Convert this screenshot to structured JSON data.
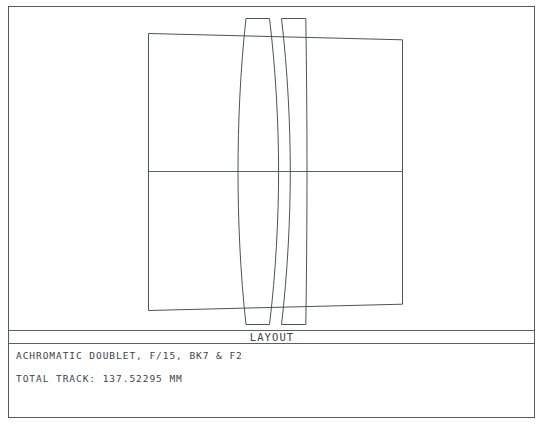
{
  "window": {
    "title": "LAYOUT",
    "background_color": "#ffffff",
    "line_color": "#4e5356",
    "text_color": "#3d4245"
  },
  "caption": {
    "panel_title": "LAYOUT",
    "description_line": "ACHROMATIC DOUBLET, F/15, BK7 & F2",
    "total_track_label": "TOTAL TRACK:",
    "total_track_value": "137.52295 MM",
    "total_track_line": "TOTAL TRACK:   137.52295 MM"
  },
  "diagram": {
    "type": "optical-layout",
    "system_name": "ACHROMATIC DOUBLET",
    "f_number": "F/15",
    "glasses": "BK7 & F2",
    "total_track_mm": "137.52295",
    "element_count": 2,
    "surface_count": 4,
    "optical_axis": "horizontal-centerline",
    "elements": [
      {
        "name": "element-1-crown",
        "glass": "BK7",
        "shape": "biconvex-meniscus"
      },
      {
        "name": "element-2-flint",
        "glass": "F2",
        "shape": "meniscus"
      }
    ],
    "ray_bundle": "marginal-ray-envelope"
  }
}
